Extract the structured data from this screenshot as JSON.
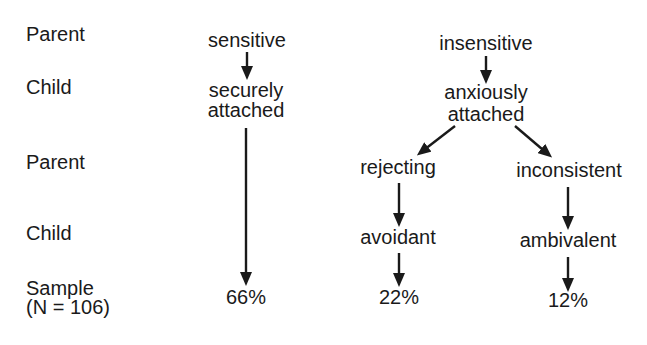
{
  "row_labels": {
    "parent_1": "Parent",
    "child_1": "Child",
    "parent_2": "Parent",
    "child_2": "Child",
    "sample": "Sample",
    "sample_n": "(N = 106)"
  },
  "secure_branch": {
    "parent": "sensitive",
    "child_line1": "securely",
    "child_line2": "attached",
    "sample_pct": "66%"
  },
  "anxious_branch": {
    "parent": "insensitive",
    "child_line1": "anxiously",
    "child_line2": "attached",
    "avoidant": {
      "parent": "rejecting",
      "child": "avoidant",
      "sample_pct": "22%"
    },
    "ambivalent": {
      "parent": "inconsistent",
      "child": "ambivalent",
      "sample_pct": "12%"
    }
  },
  "colors": {
    "ink": "#1a1a1a",
    "background": "#ffffff"
  }
}
